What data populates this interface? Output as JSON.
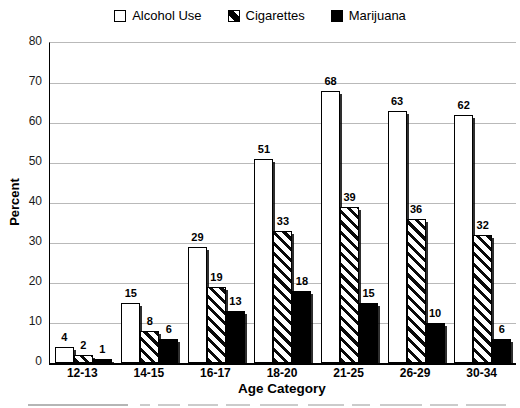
{
  "chart_data": {
    "type": "bar",
    "title": "",
    "xlabel": "Age Category",
    "ylabel": "Percent",
    "ylim": [
      0,
      80
    ],
    "yticks": [
      0,
      10,
      20,
      30,
      40,
      50,
      60,
      70,
      80
    ],
    "grid": true,
    "legend_position": "top",
    "categories": [
      "12-13",
      "14-15",
      "16-17",
      "18-20",
      "21-25",
      "26-29",
      "30-34"
    ],
    "series": [
      {
        "name": "Alcohol Use",
        "style": "white",
        "values": [
          4,
          15,
          29,
          51,
          68,
          63,
          62
        ]
      },
      {
        "name": "Cigarettes",
        "style": "hatch",
        "values": [
          2,
          8,
          19,
          33,
          39,
          36,
          32
        ]
      },
      {
        "name": "Marijuana",
        "style": "solid",
        "values": [
          1,
          6,
          13,
          18,
          15,
          10,
          6
        ]
      }
    ],
    "bar_value_labels_shown": true
  },
  "colors": {
    "background": "#ffffff",
    "bar_fill": "#ffffff",
    "bar_stroke": "#000000",
    "solid_fill": "#000000",
    "gridline": "#b9b9b9",
    "text": "#000000"
  },
  "caption_remnant": {
    "note_segments": [
      [
        28,
        100
      ],
      [
        140,
        10
      ],
      [
        158,
        22
      ],
      [
        188,
        30
      ],
      [
        226,
        24
      ],
      [
        260,
        38
      ],
      [
        308,
        36
      ],
      [
        352,
        18
      ],
      [
        380,
        42
      ],
      [
        430,
        28
      ],
      [
        466,
        40
      ]
    ]
  }
}
